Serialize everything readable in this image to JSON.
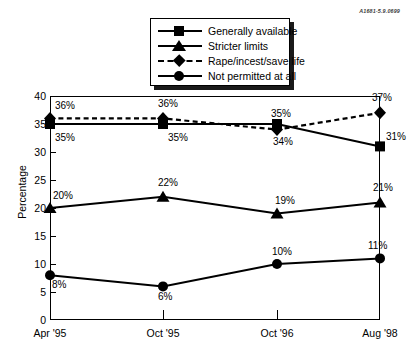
{
  "reference_code": "A1681-5.9.0699",
  "legend": {
    "items": [
      {
        "label": "Generally available",
        "marker": "square-marker",
        "line": "solid"
      },
      {
        "label": "Stricter limits",
        "marker": "triangle-marker",
        "line": "solid"
      },
      {
        "label": "Rape/incest/save life",
        "marker": "diamond-marker",
        "line": "dashed"
      },
      {
        "label": "Not permitted at all",
        "marker": "circle-marker",
        "line": "solid"
      }
    ]
  },
  "axes": {
    "y_title": "Percentage",
    "y_ticks": [
      "0",
      "5",
      "10",
      "15",
      "20",
      "25",
      "30",
      "35",
      "40"
    ],
    "x_ticks": [
      "Apr '95",
      "Oct '95",
      "Oct '96",
      "Aug '98"
    ]
  },
  "chart_data": {
    "type": "line",
    "title": "",
    "xlabel": "",
    "ylabel": "Percentage",
    "categories": [
      "Apr '95",
      "Oct '95",
      "Oct '96",
      "Aug '98"
    ],
    "ylim": [
      0,
      40
    ],
    "ytick_step": 5,
    "grid": false,
    "legend_position": "top-center",
    "series": [
      {
        "name": "Generally available",
        "marker": "square",
        "linestyle": "solid",
        "values": [
          35,
          35,
          35,
          31
        ],
        "point_labels": [
          "35%",
          "35%",
          "35%",
          "31%"
        ]
      },
      {
        "name": "Stricter limits",
        "marker": "triangle",
        "linestyle": "solid",
        "values": [
          20,
          22,
          19,
          21
        ],
        "point_labels": [
          "20%",
          "22%",
          "19%",
          "21%"
        ]
      },
      {
        "name": "Rape/incest/save life",
        "marker": "diamond",
        "linestyle": "dashed",
        "values": [
          36,
          36,
          34,
          37
        ],
        "point_labels": [
          "36%",
          "36%",
          "34%",
          "37%"
        ]
      },
      {
        "name": "Not permitted at all",
        "marker": "circle",
        "linestyle": "solid",
        "values": [
          8,
          6,
          10,
          11
        ],
        "point_labels": [
          "8%",
          "6%",
          "10%",
          "11%"
        ]
      }
    ]
  },
  "point_label_text": {
    "s0": [
      "35%",
      "35%",
      "35%",
      "31%"
    ],
    "s1": [
      "20%",
      "22%",
      "19%",
      "21%"
    ],
    "s2": [
      "36%",
      "36%",
      "34%",
      "37%"
    ],
    "s3": [
      "8%",
      "6%",
      "10%",
      "11%"
    ]
  }
}
